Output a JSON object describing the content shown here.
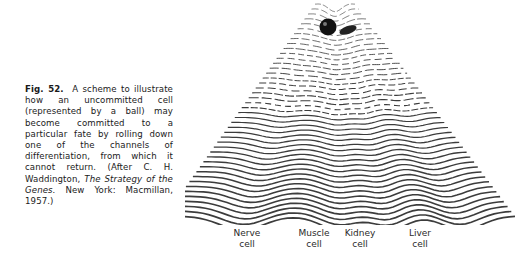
{
  "figure": {
    "number_label": "Fig. 52.",
    "caption_part1": "A scheme to illustrate how an uncommitted cell (represented by a ball) may become committed to a particular fate by rolling down one of the channels of differentiation, from which it cannot return. (After C. H. Waddington, ",
    "caption_title": "The Strategy of the Genes.",
    "caption_part2": " New York: Macmillan, 1957.)",
    "illustration": "waddington-epigenetic-landscape",
    "ball_label": "uncommitted cell (ball)"
  },
  "channel_labels": [
    {
      "line1": "Nerve",
      "line2": "cell"
    },
    {
      "line1": "Muscle",
      "line2": "cell"
    },
    {
      "line1": "Kidney",
      "line2": "cell"
    },
    {
      "line1": "Liver",
      "line2": "cell"
    }
  ]
}
